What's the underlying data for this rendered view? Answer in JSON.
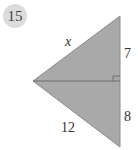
{
  "problem": {
    "number": "15"
  },
  "diagram": {
    "labels": {
      "hypotenuse_top": "x",
      "segment_top": "7",
      "segment_bottom": "8",
      "hypotenuse_bottom": "12"
    },
    "colors": {
      "fill": "#a9a9a9",
      "stroke": "#6e6e6e",
      "text": "#333333",
      "badge": "#dcdcdc"
    },
    "right_angle_marker": true
  }
}
